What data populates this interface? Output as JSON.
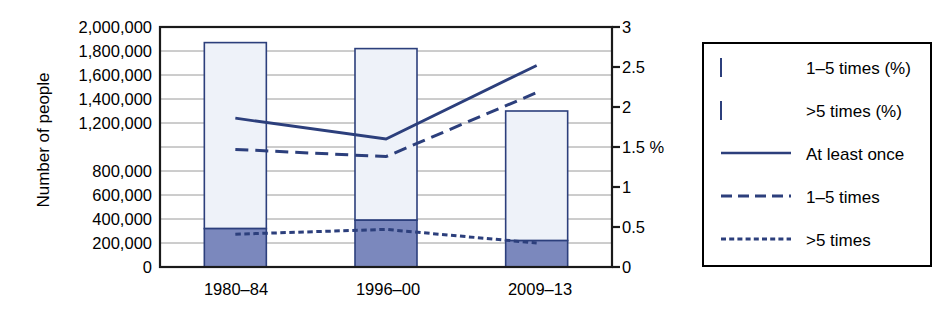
{
  "chart_data": {
    "type": "bar",
    "title": "",
    "subtitle": "",
    "categories": [
      "1980–84",
      "1996–00",
      "2009–13"
    ],
    "xlabel": "",
    "ylabel": "Number of people",
    "ylabel_right": "%",
    "ylim": [
      0,
      2000000
    ],
    "ylim_right": [
      0,
      3
    ],
    "grid": true,
    "legend_position": "right-outside",
    "stacked": true,
    "y_ticks_left": [
      "2,000,000",
      "1,800,000",
      "1,600,000",
      "1,400,000",
      "1,200,000",
      "800,000",
      "600,000",
      "400,000",
      "200,000",
      "0"
    ],
    "y_tick_values_left": [
      2000000,
      1800000,
      1600000,
      1400000,
      1200000,
      800000,
      600000,
      400000,
      200000,
      0
    ],
    "y_ticks_right": [
      "0",
      "0.5",
      "1",
      "1.5 %",
      "2",
      "2.5",
      "3"
    ],
    "y_tick_values_right": [
      0,
      0.5,
      1,
      1.5,
      2,
      2.5,
      3
    ],
    "series": [
      {
        "name": "1–5 times (%)",
        "kind": "bar",
        "axis": "left",
        "stack_order": 2,
        "values": [
          1550000,
          1430000,
          1080000
        ],
        "fill": "#eef2f9",
        "stroke": "#2c3f7c"
      },
      {
        "name": ">5 times (%)",
        "kind": "bar",
        "axis": "left",
        "stack_order": 1,
        "values": [
          320000,
          390000,
          220000
        ],
        "fill": "#7b88bd",
        "stroke": "#2c3f7c"
      },
      {
        "name": "At least once",
        "kind": "line",
        "axis": "right",
        "style": "solid",
        "values": [
          1.86,
          1.6,
          2.52
        ],
        "stroke": "#2c3f7c"
      },
      {
        "name": "1–5 times",
        "kind": "line",
        "axis": "right",
        "style": "dashed",
        "values": [
          1.47,
          1.38,
          2.18
        ],
        "stroke": "#2c3f7c"
      },
      {
        "name": ">5 times",
        "kind": "line",
        "axis": "right",
        "style": "dotted",
        "values": [
          0.41,
          0.47,
          0.3
        ],
        "stroke": "#2c3f7c"
      }
    ],
    "bar_totals": [
      1870000,
      1820000,
      1300000
    ]
  },
  "legend": {
    "items": [
      {
        "label": "1–5 times (%)",
        "type": "swatch",
        "fill": "#eef2f9",
        "stroke": "#2c3f7c"
      },
      {
        "label": ">5 times (%)",
        "type": "swatch",
        "fill": "#7b88bd",
        "stroke": "#2c3f7c"
      },
      {
        "label": "At least once",
        "type": "line-solid",
        "stroke": "#2c3f7c"
      },
      {
        "label": "1–5 times",
        "type": "line-dashed",
        "stroke": "#2c3f7c"
      },
      {
        "label": ">5 times",
        "type": "line-dotted",
        "stroke": "#2c3f7c"
      }
    ]
  },
  "colors": {
    "bar_light_fill": "#eef2f9",
    "bar_dark_fill": "#7b88bd",
    "series_stroke": "#2c3f7c",
    "axis": "#1a1a1a",
    "grid": "#9a9a9a",
    "text": "#000000",
    "background": "#ffffff"
  }
}
